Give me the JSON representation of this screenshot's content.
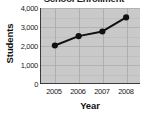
{
  "chart_data": {
    "type": "line",
    "title": "School Enrollment",
    "xlabel": "Year",
    "ylabel": "Students",
    "categories": [
      "2005",
      "2006",
      "2007",
      "2008"
    ],
    "values": [
      2000,
      2500,
      2750,
      3500
    ],
    "series": [
      {
        "name": "Students",
        "values": [
          2000,
          2500,
          2750,
          3500
        ]
      }
    ],
    "ylim": [
      0,
      4000
    ],
    "ytick_labels": [
      "4,000",
      "3,000",
      "2,000",
      "1,000",
      "0"
    ],
    "ytick_values": [
      4000,
      3000,
      2000,
      1000,
      0
    ],
    "xtick_labels": [
      "2005",
      "2006",
      "2007",
      "2008"
    ],
    "grid": true,
    "legend": "none",
    "marker": "filled-circle",
    "line_color": "#111111",
    "marker_color": "#111111",
    "plot_background": "#c9c9c9",
    "axis_color": "#3a3a3a"
  }
}
